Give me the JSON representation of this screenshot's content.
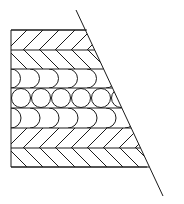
{
  "figure": {
    "type": "technical-hatching-diagram",
    "canvas": {
      "width": 184,
      "height": 204,
      "background": "#ffffff"
    },
    "stroke_color": "#1a1a1a",
    "stroke_width": 1,
    "outline": {
      "name": "trapezoid-outline",
      "left_edge": {
        "x": 11,
        "y_top": 30,
        "y_bottom": 167
      },
      "top_edge": {
        "y": 30,
        "x_left": 11,
        "x_right": 87
      },
      "bottom_edge": {
        "y": 167,
        "x_left": 11,
        "x_right": 147
      },
      "slant_edge": {
        "x_top": 76,
        "y_top": 10,
        "x_bottom": 163,
        "y_bottom": 196,
        "note": "diagonal overshoots both the top and bottom corners"
      }
    },
    "band_boundaries_y": [
      30,
      50,
      69,
      88,
      108,
      128,
      148,
      167
    ],
    "bands": [
      {
        "index": 0,
        "label": "hatch-forward-top",
        "pattern": "hatch",
        "slope": "forward",
        "y_top": 30,
        "y_bottom": 50,
        "spacing": 16
      },
      {
        "index": 1,
        "label": "hatch-backward-upper",
        "pattern": "hatch",
        "slope": "backward",
        "y_top": 50,
        "y_bottom": 69,
        "spacing": 16
      },
      {
        "index": 2,
        "label": "arcs-upper",
        "pattern": "arcs",
        "bulge": "right",
        "y_top": 69,
        "y_bottom": 88,
        "spacing": 19
      },
      {
        "index": 3,
        "label": "circles-middle",
        "pattern": "circles",
        "count": 6,
        "y_top": 88,
        "y_bottom": 108,
        "diameter": 20
      },
      {
        "index": 4,
        "label": "arcs-lower",
        "pattern": "arcs",
        "bulge": "right",
        "y_top": 108,
        "y_bottom": 128,
        "spacing": 19
      },
      {
        "index": 5,
        "label": "hatch-forward-lower",
        "pattern": "hatch",
        "slope": "forward",
        "y_top": 128,
        "y_bottom": 148,
        "spacing": 16
      },
      {
        "index": 6,
        "label": "hatch-backward-bottom",
        "pattern": "hatch",
        "slope": "backward",
        "y_top": 148,
        "y_bottom": 167,
        "spacing": 16
      }
    ]
  }
}
